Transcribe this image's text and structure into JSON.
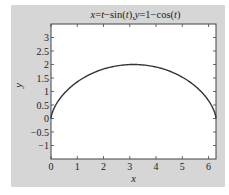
{
  "chart_data": {
    "type": "line",
    "title": "x=t−sin(t),y=1−cos(t)",
    "xlabel": "x",
    "ylabel": "y",
    "xlim": [
      0,
      6.2832
    ],
    "ylim": [
      -1.5,
      3.5
    ],
    "xticks": [
      "0",
      "1",
      "2",
      "3",
      "4",
      "5",
      "6"
    ],
    "yticks": [
      "−1",
      "−0.5",
      "0",
      "0.5",
      "1",
      "1.5",
      "2",
      "2.5",
      "3"
    ],
    "grid": false,
    "series": [
      {
        "name": "cycloid",
        "x": [
          0,
          0.021,
          0.1606,
          0.515,
          1.1416,
          2.0348,
          3.1416,
          4.2484,
          5.1416,
          5.7682,
          6.1226,
          6.2622,
          6.2832
        ],
        "y": [
          0,
          0.134,
          0.5,
          1.0,
          1.5,
          1.866,
          2.0,
          1.866,
          1.5,
          1.0,
          0.5,
          0.134,
          0
        ]
      }
    ],
    "colors": {
      "line": "#333333",
      "figure_bg": "#d6d6d6",
      "axes_bg": "#ffffff"
    }
  }
}
